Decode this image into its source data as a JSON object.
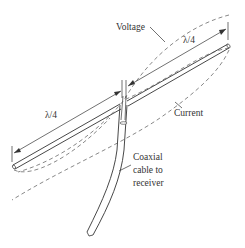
{
  "diagram": {
    "labels": {
      "voltage": "Voltage",
      "current": "Current",
      "lambda_upper": "λ/4",
      "lambda_lower": "λ/4",
      "coax_line1": "Coaxial",
      "coax_line2": "cable to",
      "coax_line3": "receiver"
    },
    "colors": {
      "line": "#333333",
      "dashed": "#555555",
      "background": "#ffffff"
    }
  }
}
